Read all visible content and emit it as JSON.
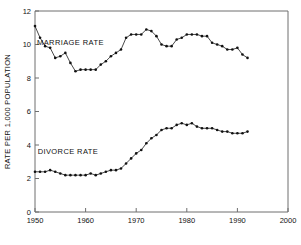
{
  "chart_data": {
    "type": "line",
    "title": "",
    "xlabel": "",
    "ylabel": "RATE PER 1,000 POPULATION",
    "xlim": [
      1950,
      2000
    ],
    "ylim": [
      0,
      12
    ],
    "xticks": [
      1950,
      1960,
      1970,
      1980,
      1990,
      2000
    ],
    "yticks": [
      0,
      2,
      4,
      6,
      8,
      10,
      12
    ],
    "xtick_labels": [
      "1950",
      "1960",
      "1970",
      "1980",
      "1990",
      "2000"
    ],
    "ytick_labels": [
      "0",
      "2",
      "4",
      "6",
      "8",
      "10",
      "12"
    ],
    "grid": false,
    "legend": "inline-annotations",
    "annotations": [
      {
        "text": "MARRIAGE RATE",
        "x": 1957.0,
        "y": 10.0
      },
      {
        "text": "DIVORCE RATE",
        "x": 1956.5,
        "y": 3.45
      }
    ],
    "series": [
      {
        "name": "MARRIAGE RATE",
        "x": [
          1950,
          1951,
          1952,
          1953,
          1954,
          1955,
          1956,
          1957,
          1958,
          1959,
          1960,
          1961,
          1962,
          1963,
          1964,
          1965,
          1966,
          1967,
          1968,
          1969,
          1970,
          1971,
          1972,
          1973,
          1974,
          1975,
          1976,
          1977,
          1978,
          1979,
          1980,
          1981,
          1982,
          1983,
          1984,
          1985,
          1986,
          1987,
          1988,
          1989,
          1990,
          1991,
          1992
        ],
        "values": [
          11.1,
          10.4,
          9.9,
          9.8,
          9.2,
          9.3,
          9.5,
          8.9,
          8.4,
          8.5,
          8.5,
          8.5,
          8.5,
          8.8,
          9.0,
          9.3,
          9.5,
          9.7,
          10.4,
          10.6,
          10.6,
          10.6,
          10.9,
          10.8,
          10.5,
          10.0,
          9.9,
          9.9,
          10.3,
          10.4,
          10.6,
          10.6,
          10.6,
          10.5,
          10.5,
          10.1,
          10.0,
          9.9,
          9.7,
          9.7,
          9.8,
          9.4,
          9.2
        ]
      },
      {
        "name": "DIVORCE RATE",
        "x": [
          1950,
          1951,
          1952,
          1953,
          1954,
          1955,
          1956,
          1957,
          1958,
          1959,
          1960,
          1961,
          1962,
          1963,
          1964,
          1965,
          1966,
          1967,
          1968,
          1969,
          1970,
          1971,
          1972,
          1973,
          1974,
          1975,
          1976,
          1977,
          1978,
          1979,
          1980,
          1981,
          1982,
          1983,
          1984,
          1985,
          1986,
          1987,
          1988,
          1989,
          1990,
          1991,
          1992
        ],
        "values": [
          2.4,
          2.4,
          2.4,
          2.5,
          2.4,
          2.3,
          2.2,
          2.2,
          2.2,
          2.2,
          2.2,
          2.3,
          2.2,
          2.3,
          2.4,
          2.5,
          2.5,
          2.6,
          2.9,
          3.2,
          3.5,
          3.7,
          4.1,
          4.4,
          4.6,
          4.9,
          5.0,
          5.0,
          5.2,
          5.3,
          5.2,
          5.3,
          5.1,
          5.0,
          5.0,
          5.0,
          4.9,
          4.8,
          4.8,
          4.7,
          4.7,
          4.7,
          4.8
        ]
      }
    ]
  },
  "layout": {
    "plot_left": 35,
    "plot_right": 288,
    "plot_top": 11,
    "plot_bottom": 212,
    "marker_radius": 1.3
  }
}
